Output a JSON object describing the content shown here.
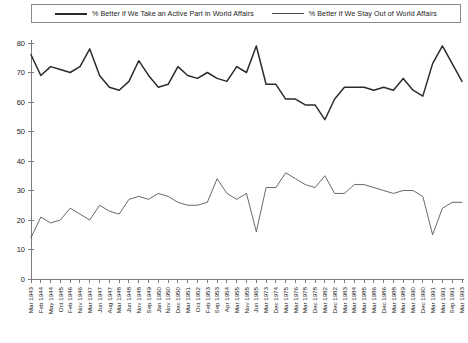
{
  "legend": {
    "entries": [
      {
        "label": "% Better if We Take an Active Part in World Affairs",
        "style": "thick",
        "color": "#2b2b2b"
      },
      {
        "label": "% Better if We Stay Out of World Affairs",
        "style": "thin",
        "color": "#4e4e4e"
      }
    ]
  },
  "chart_data": {
    "type": "line",
    "title": "",
    "subtitle": "",
    "xlabel": "",
    "ylabel": "",
    "ylim": [
      0,
      80
    ],
    "yticks": [
      0,
      10,
      20,
      30,
      40,
      50,
      60,
      70,
      80
    ],
    "grid": false,
    "legend_position": "top",
    "categories": [
      "Mar 1943",
      "Feb 1944",
      "May 1944",
      "Oct 1945",
      "Feb 1946",
      "Nov 1946",
      "Mar 1947",
      "Jun 1947",
      "Aug 1947",
      "Mar 1948",
      "Jun 1948",
      "Nov 1948",
      "Sep 1949",
      "Jan 1950",
      "Nov 1950",
      "Dec 1950",
      "Mar 1951",
      "Oct 1952",
      "Feb 1953",
      "Sep 1953",
      "Apr 1954",
      "Mar 1955",
      "Nov 1955",
      "Jun 1965",
      "Mar 1973",
      "Dec 1974",
      "Mar 1975",
      "Mar 1976",
      "Mar 1978",
      "Dec 1978",
      "Mar 1982",
      "Dec 1982",
      "Mar 1983",
      "Mar 1984",
      "Mar 1985",
      "Mar 1986",
      "Dec 1986",
      "Mar 1988",
      "Mar 1989",
      "Mar 1990",
      "Dec 1990",
      "Mar 1991",
      "Mar 1991",
      "Sep 1991",
      "Mar 1993"
    ],
    "series": [
      {
        "name": "% Better if We Take an Active Part in World Affairs",
        "color": "#2b2b2b",
        "values": [
          76,
          69,
          72,
          71,
          70,
          72,
          78,
          69,
          65,
          64,
          67,
          74,
          69,
          65,
          66,
          72,
          69,
          68,
          70,
          68,
          67,
          72,
          70,
          79,
          66,
          66,
          61,
          61,
          59,
          59,
          54,
          61,
          65,
          65,
          65,
          64,
          65,
          64,
          68,
          64,
          62,
          73,
          79,
          73,
          67
        ]
      },
      {
        "name": "% Better if We Stay Out of World Affairs",
        "color": "#4e4e4e",
        "values": [
          14,
          21,
          19,
          20,
          24,
          22,
          20,
          25,
          23,
          22,
          27,
          28,
          27,
          29,
          28,
          26,
          25,
          25,
          26,
          34,
          29,
          27,
          29,
          16,
          31,
          31,
          36,
          34,
          32,
          31,
          35,
          29,
          29,
          32,
          32,
          31,
          30,
          29,
          30,
          30,
          28,
          15,
          24,
          26,
          26
        ]
      }
    ]
  }
}
